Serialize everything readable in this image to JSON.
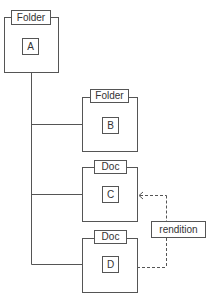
{
  "nodes": [
    {
      "id": "A",
      "type_label": "Folder",
      "name": "A"
    },
    {
      "id": "B",
      "type_label": "Folder",
      "name": "B"
    },
    {
      "id": "C",
      "type_label": "Doc",
      "name": "C"
    },
    {
      "id": "D",
      "type_label": "Doc",
      "name": "D"
    }
  ],
  "edges": [
    {
      "from": "A",
      "to": "B",
      "style": "solid"
    },
    {
      "from": "A",
      "to": "C",
      "style": "solid"
    },
    {
      "from": "A",
      "to": "D",
      "style": "solid"
    },
    {
      "from": "D",
      "to": "C",
      "style": "dashed",
      "label": "rendition"
    }
  ],
  "rendition_label": "rendition",
  "colors": {
    "stroke": "#555555",
    "background": "#ffffff"
  }
}
